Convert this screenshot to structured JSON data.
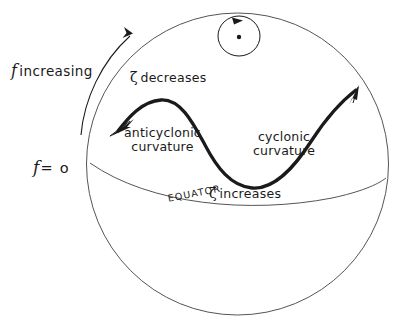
{
  "figure": {
    "kind": "conceptual-diagram",
    "background_color": "#ffffff",
    "ink_color": "#1a1a1a",
    "globe_line_color": "#555555"
  },
  "labels": {
    "f_increasing": {
      "symbol": "f",
      "text": "increasing"
    },
    "f_zero": {
      "symbol": "f",
      "text": "= o"
    },
    "zeta_decreases": {
      "symbol": "ζ",
      "text": "decreases"
    },
    "zeta_increases": {
      "symbol": "ζ",
      "text": "increases"
    },
    "anticyclonic": {
      "line1": "anticyclonic",
      "line2": "curvature"
    },
    "cyclonic": {
      "line1": "cyclonic",
      "line2": "curvature"
    },
    "equator": "EQUATOR"
  },
  "annotations": {
    "rotation_indicator": {
      "name": "earth-rotation-circle",
      "direction": "counterclockwise",
      "has_center_dot": true
    },
    "flow_arrow_heads": 2,
    "f_gradient_arrow": "curved arrow pointing poleward along the limb"
  }
}
